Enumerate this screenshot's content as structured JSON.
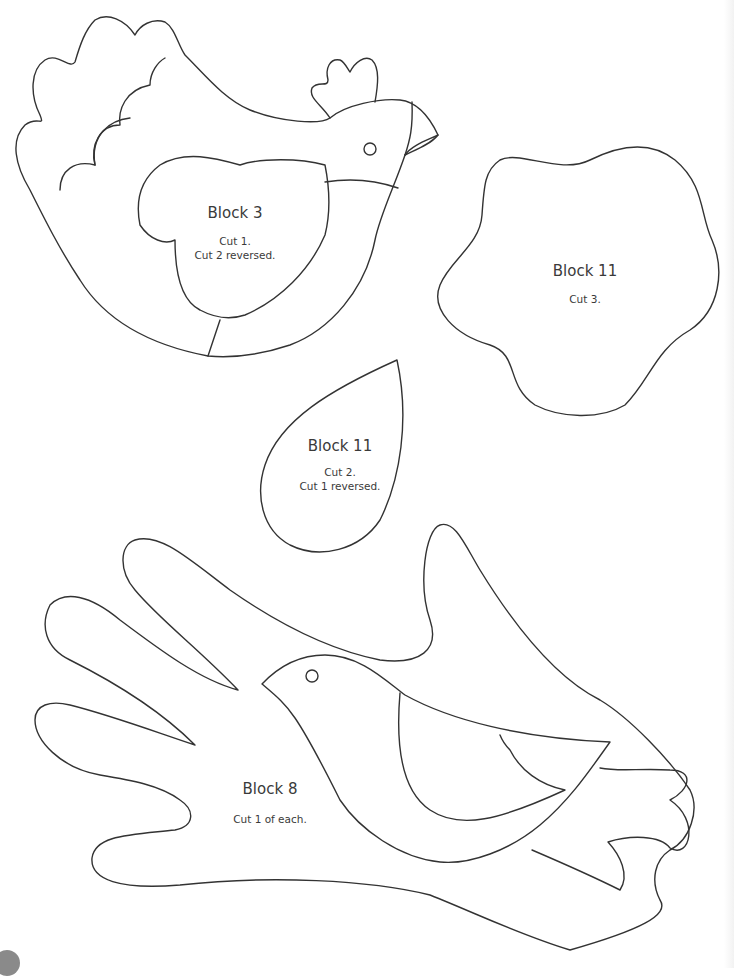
{
  "page": {
    "background": "#ffffff",
    "line_color": "#333333"
  },
  "templates": [
    {
      "id": "block3-hen",
      "title": "Block 3",
      "lines": [
        "Cut 1.",
        "Cut 2 reversed."
      ]
    },
    {
      "id": "block11-flower",
      "title": "Block 11",
      "lines": [
        "Cut 3."
      ]
    },
    {
      "id": "block11-petal",
      "title": "Block 11",
      "lines": [
        "Cut 2.",
        "Cut 1 reversed."
      ]
    },
    {
      "id": "block8-hand-bird",
      "title": "Block 8",
      "lines": [
        "Cut 1 of each."
      ]
    }
  ]
}
